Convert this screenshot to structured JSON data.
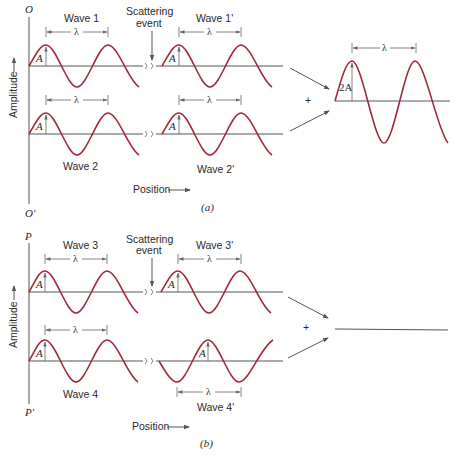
{
  "panel_a": {
    "top_label": "O",
    "bottom_label": "O'",
    "ylabel": "Amplitude",
    "xlabel": "Position",
    "caption": "(a)",
    "scattering_label_line1": "Scattering",
    "scattering_label_line2": "event",
    "waves": [
      {
        "name": "Wave 1",
        "amplitude_label": "A",
        "wavelength_label": "λ"
      },
      {
        "name": "Wave 1'",
        "amplitude_label": "A",
        "wavelength_label": "λ"
      },
      {
        "name": "Wave 2",
        "amplitude_label": "A",
        "wavelength_label": "λ"
      },
      {
        "name": "Wave 2'",
        "amplitude_label": "A",
        "wavelength_label": "λ"
      }
    ],
    "plus": "+",
    "result": {
      "amplitude_label": "2A",
      "wavelength_label": "λ",
      "description": "constructive interference"
    }
  },
  "panel_b": {
    "top_label": "P",
    "bottom_label": "P'",
    "ylabel": "Amplitude",
    "xlabel": "Position",
    "caption": "(b)",
    "scattering_label_line1": "Scattering",
    "scattering_label_line2": "event",
    "waves": [
      {
        "name": "Wave 3",
        "amplitude_label": "A",
        "wavelength_label": "λ"
      },
      {
        "name": "Wave 3'",
        "amplitude_label": "A",
        "wavelength_label": "λ"
      },
      {
        "name": "Wave 4",
        "amplitude_label": "A",
        "wavelength_label": "λ"
      },
      {
        "name": "Wave 4'",
        "amplitude_label": "A",
        "wavelength_label": "λ"
      }
    ],
    "plus": "+",
    "result": {
      "description": "destructive interference (flat line)"
    }
  },
  "colors": {
    "wave": "#a0283a",
    "axis": "#555555",
    "text": "#2a2a2a"
  }
}
